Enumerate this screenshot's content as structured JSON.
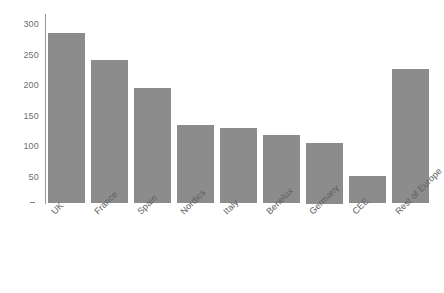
{
  "chart_data": {
    "type": "bar",
    "title": "",
    "xlabel": "",
    "ylabel": "",
    "categories": [
      "UK",
      "France",
      "Spain",
      "Nordics",
      "Italy",
      "Benelux",
      "Germany",
      "CEE",
      "Rest of Europe"
    ],
    "values": [
      280,
      235,
      190,
      128,
      123,
      112,
      100,
      45,
      220
    ],
    "ylim": [
      0,
      300
    ],
    "yticks": [
      "300",
      "250",
      "200",
      "150",
      "100",
      "50",
      "-"
    ],
    "ytick_values": [
      300,
      250,
      200,
      150,
      100,
      50,
      0
    ],
    "grid": false,
    "legend": null,
    "bar_color": "#8c8c8c",
    "axis_color": "#9a9a9a",
    "tick_label_color": "#6f6f6f",
    "category_label_color": "#5e5e5e",
    "category_label_rotation": -45
  }
}
